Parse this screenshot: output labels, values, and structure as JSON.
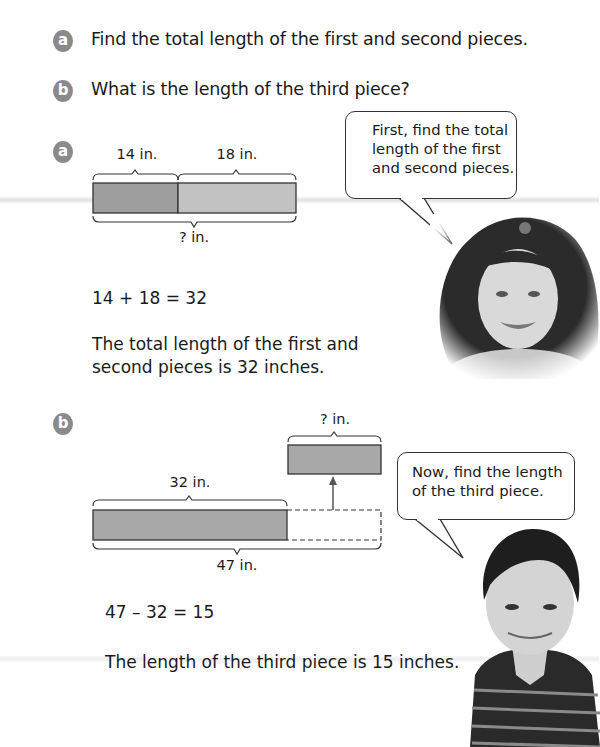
{
  "questions": [
    {
      "badge": "a",
      "text": "Find the total length of the first and second pieces."
    },
    {
      "badge": "b",
      "text": "What is the length of the third piece?"
    }
  ],
  "part_a": {
    "badge": "a",
    "diagram": {
      "segment1_label": "14 in.",
      "segment2_label": "18 in.",
      "total_label": "? in.",
      "segment1_color": "#9a9a9a",
      "segment2_color": "#bdbdbd"
    },
    "equation": "14 + 18 = 32",
    "statement_lines": [
      "The total length of the first and",
      "second pieces is 32 inches."
    ],
    "speech_bubble_lines": [
      "First, find the total",
      "length of the first",
      "and second pieces."
    ],
    "photo": "girl-smiling-photo"
  },
  "part_b": {
    "badge": "b",
    "diagram": {
      "known_label": "32 in.",
      "unknown_label": "? in.",
      "total_label": "47 in.",
      "bar_color": "#a8a8a8"
    },
    "equation": "47 – 32 = 15",
    "statement": "The length of the third piece is 15 inches.",
    "speech_bubble_lines": [
      "Now, find the length",
      "of the third piece."
    ],
    "photo": "boy-smiling-photo"
  }
}
